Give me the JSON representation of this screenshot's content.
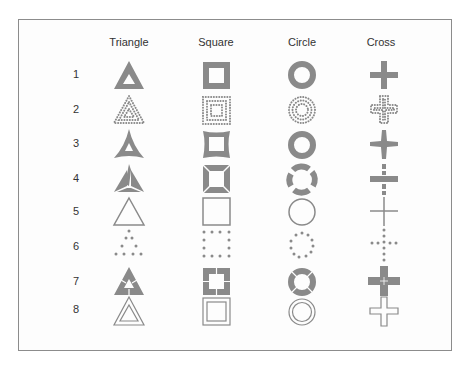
{
  "columns": [
    "Triangle",
    "Square",
    "Circle",
    "Cross"
  ],
  "rows": [
    {
      "label": "1",
      "style": "solid-thick"
    },
    {
      "label": "2",
      "style": "dense-dotted"
    },
    {
      "label": "3",
      "style": "concave"
    },
    {
      "label": "4",
      "style": "segmented"
    },
    {
      "label": "5",
      "style": "thin-outline"
    },
    {
      "label": "6",
      "style": "sparse-dotted"
    },
    {
      "label": "7",
      "style": "thick-with-cuts"
    },
    {
      "label": "8",
      "style": "double-outline"
    }
  ],
  "colors": {
    "shape": "#8a8a8a",
    "frame": "#8c8c8c",
    "text": "#333333",
    "background": "#fdfdfd"
  }
}
